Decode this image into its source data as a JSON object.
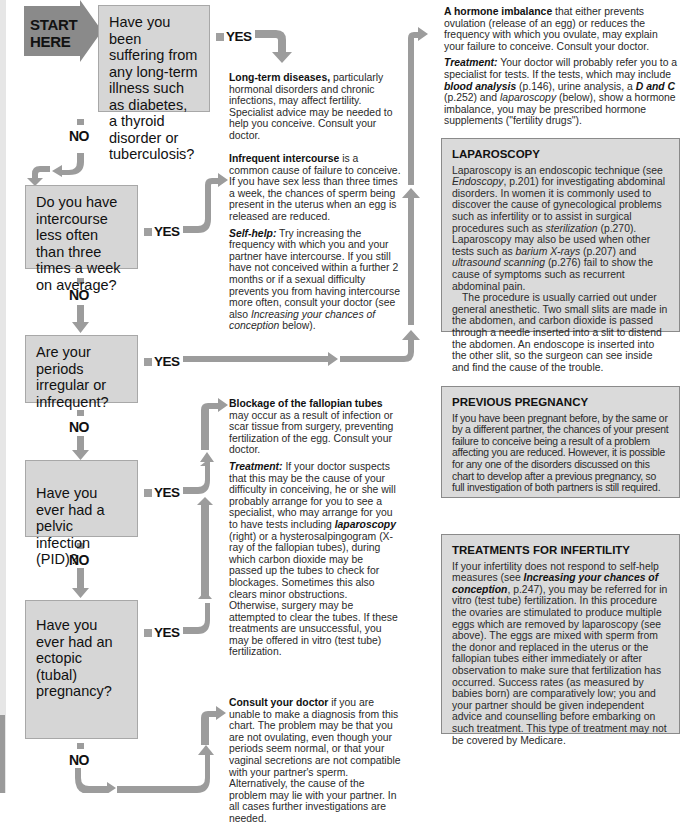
{
  "start": {
    "line1": "START",
    "line2": "HERE"
  },
  "questions": [
    {
      "text": "Have you been suffering from any long-term illness such as diabetes, a thyroid disorder or tuberculosis?"
    },
    {
      "text": "Do you have intercourse less often than three times a week on average?"
    },
    {
      "text": "Are your periods irregular or infrequent?"
    },
    {
      "text": "Have you ever had a pelvic infection (PID)?"
    },
    {
      "text": "Have you ever had an ectopic (tubal) pregnancy?"
    }
  ],
  "labels": {
    "yes": "YES",
    "no": "NO"
  },
  "outcomes": {
    "long_term": {
      "bold": "Long-term diseases,",
      "text": " particularly hormonal disorders and chronic infections, may affect fertility. Specialist advice may be needed to help you conceive. Consult your doctor."
    },
    "intercourse": {
      "bold": "Infrequent intercourse",
      "text": " is a common cause of failure to conceive. If you have sex less than three times a week, the chances of sperm being present in the uterus when an egg is released are reduced.",
      "selfhelp_label": "Self-help:",
      "selfhelp_text1": " Try increasing the frequency with which you and your partner have intercourse. If you still have not conceived within a further 2 months or if a sexual difficulty prevents you from having intercourse more often, consult your doctor (see also ",
      "selfhelp_link": "Increasing your chances of conception",
      "selfhelp_text2": " below)."
    },
    "hormone": {
      "bold": "A hormone imbalance",
      "text": " that either prevents ovulation (release of an egg) or reduces the frequency with which you ovulate, may explain your failure to conceive. Consult your doctor.",
      "treatment_label": "Treatment:",
      "t1": " Your doctor will probably refer you to a specialist for tests. If the tests, which may include ",
      "link1": "blood analysis",
      "t2": " (p.146), urine analysis, a ",
      "link2": "D and C",
      "t3": " (p.252) and ",
      "link3": "laparoscopy",
      "t4": " (below), show a hormone imbalance, you may be prescribed hormone supplements (\"fertility drugs\")."
    },
    "blockage": {
      "bold": "Blockage of the fallopian tubes",
      "text": " may occur as a result of infection or scar tissue from surgery, preventing fertilization of the egg. Consult your doctor.",
      "treatment_label": "Treatment:",
      "t1": " If your doctor suspects that this may be the cause of your difficulty in conceiving, he or she will probably arrange for you to see a specialist, who may arrange for you to have tests including ",
      "link1": "laparoscopy",
      "t2": " (right) or a hysterosalpingogram (X-ray of the fallopian tubes), during which carbon dioxide may be passed up the tubes to check for blockages. Sometimes this also clears minor obstructions. Otherwise, surgery may be attempted to clear the tubes. If these treatments are unsuccessful, you may be offered in vitro (test tube) fertilization."
    },
    "consult": {
      "bold": "Consult your doctor",
      "text": " if you are unable to make a diagnosis from this chart. The problem may be that you are not ovulating, even though your periods seem normal, or that your vaginal secretions are not compatible with your partner's sperm. Alternatively, the cause of the problem may lie with your partner. In all cases further investigations are needed."
    }
  },
  "sidebars": {
    "laparoscopy": {
      "title": "LAPAROSCOPY",
      "p1a": "Laparoscopy is an endoscopic technique (see ",
      "p1_link1": "Endoscopy",
      "p1b": ", p.201) for investigating abdominal disorders. In women it is commonly used to discover the cause of gynecological problems such as infertility or to assist in surgical procedures such as ",
      "p1_link2": "sterilization",
      "p1c": " (p.270). Laparoscopy may also be used when other tests such as ",
      "p1_link3": "barium X-rays",
      "p1d": " (p.207) and ",
      "p1_link4": "ultrasound scanning",
      "p1e": " (p.276) fail to show the cause of symptoms such as recurrent abdominal pain.",
      "p2": "The procedure is usually carried out under general anesthetic. Two small slits are made in the abdomen, and carbon dioxide is passed through a needle inserted into a slit to distend the abdomen. An endoscope is inserted into the other slit, so the surgeon can see inside and find the cause of the trouble."
    },
    "previous_pregnancy": {
      "title": "PREVIOUS PREGNANCY",
      "text": "If you have been pregnant before, by the same or by a different partner, the chances of your present failure to conceive being a result of a problem affecting you are reduced. However, it is possible for any one of the disorders discussed on this chart to develop after a previous pregnancy, so full investigation of both partners is still required."
    },
    "treatments": {
      "title": "TREATMENTS FOR INFERTILITY",
      "t1": "If your infertility does not respond to self-help measures (see ",
      "link1": "Increasing your chances of conception",
      "t2": ", p.247), you may be referred for in vitro (test tube) fertilization. In this procedure the ovaries are stimulated to produce multiple eggs which are removed by laparoscopy (see above). The eggs are mixed with sperm from the donor and replaced in the uterus or the fallopian tubes either immediately or after observation to make sure that fertilization has occurred. Success rates (as measured by babies born) are comparatively low; you and your partner should be given independent advice and counselling before embarking on such treatment. This type of treatment may not be covered by Medicare."
    }
  },
  "colors": {
    "box_fill": "#d6d6d6",
    "arrow": "#9c9c9c",
    "start_fill": "#8a8a8a",
    "sidebar_fill": "#dadada"
  }
}
